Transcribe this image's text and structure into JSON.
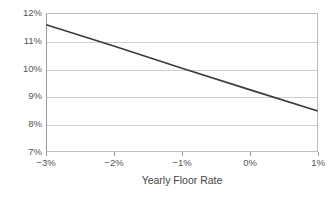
{
  "chart_data": {
    "type": "line",
    "title": "",
    "subtitle": "",
    "xlabel": "Yearly Floor Rate",
    "ylabel": "",
    "xlim": [
      -3,
      1
    ],
    "ylim": [
      7,
      12
    ],
    "grid": true,
    "legend": false,
    "legend_position": "none",
    "x_tick_labels": [
      "−3%",
      "−2%",
      "−1%",
      "0%",
      "1%"
    ],
    "x_tick_values": [
      -3,
      -2,
      -1,
      0,
      1
    ],
    "y_tick_labels": [
      "12%",
      "11%",
      "10%",
      "9%",
      "8%",
      "7%"
    ],
    "y_tick_values": [
      12,
      11,
      10,
      9,
      8,
      7
    ],
    "series": [
      {
        "name": "",
        "color": "#3a3a3a",
        "line_width": 1.6,
        "x": [
          -3,
          -2,
          -1,
          0,
          1
        ],
        "y": [
          11.6,
          10.82,
          10.02,
          9.24,
          8.47
        ]
      }
    ],
    "annotations": []
  },
  "style": {
    "background": "#ffffff",
    "plot_border_color": "#bfbfbf",
    "axis_color": "#9a9a9a",
    "gridline_color": "#cfcfcf",
    "tick_label_color": "#555555",
    "axis_title_color": "#444444"
  }
}
